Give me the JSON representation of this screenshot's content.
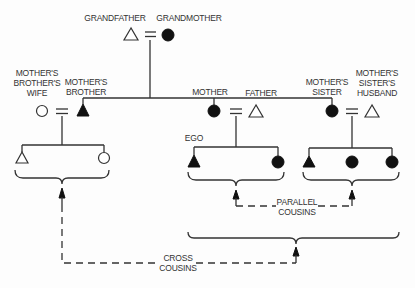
{
  "diagram": {
    "type": "kinship",
    "labels": {
      "grandfather": "GRANDFATHER",
      "grandmother": "GRANDMOTHER",
      "mbw_1": "MOTHER'S",
      "mbw_2": "BROTHER'S",
      "mbw_3": "WIFE",
      "mb_1": "MOTHER'S",
      "mb_2": "BROTHER",
      "mother": "MOTHER",
      "father": "FATHER",
      "ms_1": "MOTHER'S",
      "ms_2": "SISTER",
      "msh_1": "MOTHER'S",
      "msh_2": "SISTER'S",
      "msh_3": "HUSBAND",
      "ego": "EGO",
      "parallel_1": "PARALLEL",
      "parallel_2": "COUSINS",
      "cross_1": "CROSS",
      "cross_2": "COUSINS"
    },
    "legend_semantics": {
      "triangle": "male",
      "circle": "female",
      "filled": "consanguineal (lineage) member",
      "equals": "marriage"
    },
    "nodes": [
      {
        "id": "grandfather",
        "shape": "triangle",
        "filled": false
      },
      {
        "id": "grandmother",
        "shape": "circle",
        "filled": true
      },
      {
        "id": "mothers-brothers-wife",
        "shape": "circle",
        "filled": false
      },
      {
        "id": "mothers-brother",
        "shape": "triangle",
        "filled": true
      },
      {
        "id": "mother",
        "shape": "circle",
        "filled": true
      },
      {
        "id": "father",
        "shape": "triangle",
        "filled": false
      },
      {
        "id": "mothers-sister",
        "shape": "circle",
        "filled": true
      },
      {
        "id": "mothers-sisters-husband",
        "shape": "triangle",
        "filled": false
      },
      {
        "id": "mb-son",
        "shape": "triangle",
        "filled": false
      },
      {
        "id": "mb-daughter",
        "shape": "circle",
        "filled": false
      },
      {
        "id": "ego",
        "shape": "triangle",
        "filled": true
      },
      {
        "id": "ego-sister",
        "shape": "circle",
        "filled": true
      },
      {
        "id": "ms-son",
        "shape": "triangle",
        "filled": true
      },
      {
        "id": "ms-daughter-1",
        "shape": "circle",
        "filled": true
      },
      {
        "id": "ms-daughter-2",
        "shape": "circle",
        "filled": true
      }
    ]
  }
}
